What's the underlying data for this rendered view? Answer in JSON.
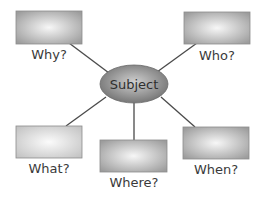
{
  "diagram": {
    "center": {
      "label": "Subject",
      "cx": 134,
      "cy": 84,
      "rx": 34,
      "ry": 19
    },
    "nodes": [
      {
        "id": "why",
        "label": "Why?",
        "x": 16,
        "y": 11,
        "w": 66,
        "h": 33,
        "lx": 49,
        "ly": 59,
        "line": [
          69,
          43,
          109,
          73
        ]
      },
      {
        "id": "who",
        "label": "Who?",
        "x": 184,
        "y": 12,
        "w": 66,
        "h": 32,
        "lx": 217,
        "ly": 60,
        "line": [
          197,
          43,
          157,
          72
        ]
      },
      {
        "id": "what",
        "label": "What?",
        "x": 16,
        "y": 126,
        "w": 66,
        "h": 32,
        "lx": 49,
        "ly": 173,
        "line": [
          66,
          126,
          106,
          97
        ]
      },
      {
        "id": "where",
        "label": "Where?",
        "x": 100,
        "y": 140,
        "w": 67,
        "h": 32,
        "lx": 134,
        "ly": 187,
        "line": [
          134,
          140,
          134,
          103
        ]
      },
      {
        "id": "when",
        "label": "When?",
        "x": 183,
        "y": 127,
        "w": 66,
        "h": 32,
        "lx": 216,
        "ly": 174,
        "line": [
          195,
          127,
          161,
          97
        ]
      }
    ],
    "colors": {
      "box_edge": "#9a9a9a",
      "box_center": "#f4f4f4",
      "box_border": "#8c8c8c",
      "ellipse_edge": "#6e6e6e",
      "ellipse_center": "#c8c8c8",
      "line": "#4a4a4a",
      "text": "#3a3a3a"
    }
  }
}
